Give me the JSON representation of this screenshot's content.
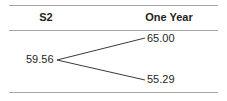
{
  "table": {
    "columns": [
      {
        "id": "col-s2",
        "label": "S2"
      },
      {
        "id": "col-one-year",
        "label": "One Year"
      }
    ]
  },
  "chart_data": {
    "type": "diagram",
    "subtype": "binomial-lattice",
    "title": "S2",
    "period_label": "One Year",
    "xlabel": "",
    "ylabel": "",
    "grid": false,
    "legend": false,
    "nodes": [
      {
        "id": "root",
        "label": "59.56",
        "value": 59.56,
        "x": 57,
        "y": 60
      },
      {
        "id": "up",
        "label": "65.00",
        "value": 65.0,
        "x": 145,
        "y": 38
      },
      {
        "id": "down",
        "label": "55.29",
        "value": 55.29,
        "x": 145,
        "y": 80
      }
    ],
    "edges": [
      {
        "from": "root",
        "to": "up",
        "x1": 57,
        "y1": 60,
        "x2": 145,
        "y2": 38
      },
      {
        "from": "root",
        "to": "down",
        "x1": 57,
        "y1": 60,
        "x2": 145,
        "y2": 80
      }
    ]
  },
  "colors": {
    "rule": "#a6a6a6",
    "text": "#231f20",
    "line": "#3a3a3a",
    "background": "#ffffff"
  }
}
